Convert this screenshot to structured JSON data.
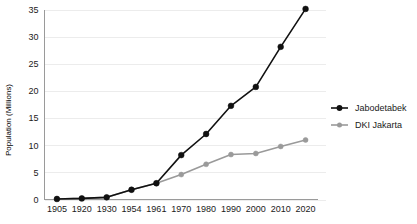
{
  "chart_data": {
    "type": "line",
    "title": "",
    "xlabel": "",
    "ylabel": "Population (Millions)",
    "categories": [
      "1905",
      "1920",
      "1930",
      "1954",
      "1961",
      "1970",
      "1980",
      "1990",
      "2000",
      "2010",
      "2020"
    ],
    "ylim": [
      0,
      35
    ],
    "yticks": [
      0,
      5,
      10,
      15,
      20,
      25,
      30,
      35
    ],
    "ytick_labels": [
      "0",
      "5",
      "10",
      "15",
      "20",
      "25",
      "30",
      "35"
    ],
    "grid": true,
    "grid_axis": "y",
    "legend_position": "right",
    "series": [
      {
        "name": "Jabodetabek",
        "color": "#111111",
        "marker": "circle",
        "values": [
          0.1,
          0.2,
          0.4,
          1.8,
          3.0,
          8.2,
          12.1,
          17.3,
          20.8,
          28.2,
          35.2
        ]
      },
      {
        "name": "DKI Jakarta",
        "color": "#9a9a9a",
        "marker": "circle",
        "values": [
          0.1,
          0.2,
          0.4,
          1.8,
          3.0,
          4.6,
          6.5,
          8.3,
          8.5,
          9.8,
          11.0
        ]
      }
    ]
  },
  "legend": {
    "items": [
      {
        "label": "Jabodetabek",
        "color": "#111111"
      },
      {
        "label": "DKI Jakarta",
        "color": "#9a9a9a"
      }
    ]
  },
  "axes": {
    "y_title": "Population (Millions)"
  },
  "colors": {
    "background": "#ffffff",
    "gridline": "#ececec",
    "axis": "#9a9a9a",
    "series_primary": "#111111",
    "series_secondary": "#9a9a9a"
  }
}
